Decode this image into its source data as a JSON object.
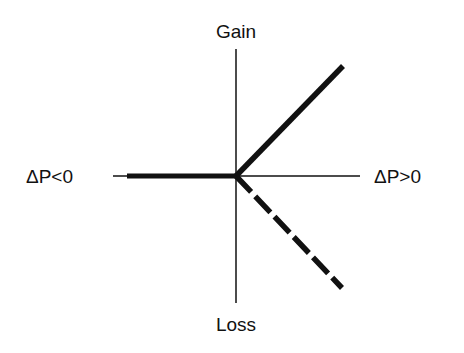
{
  "diagram": {
    "labels": {
      "top": "Gain",
      "bottom": "Loss",
      "left": "ΔP<0",
      "right": "ΔP>0"
    },
    "colors": {
      "axis": "#111111",
      "line": "#111111",
      "background": "#ffffff"
    },
    "lines": [
      {
        "name": "no-change-line",
        "style": "solid",
        "from": "origin",
        "to": "negative ΔP"
      },
      {
        "name": "gain-line",
        "style": "solid",
        "from": "origin",
        "to": "upper right"
      },
      {
        "name": "loss-line",
        "style": "dashed",
        "from": "origin",
        "to": "lower right"
      }
    ]
  }
}
